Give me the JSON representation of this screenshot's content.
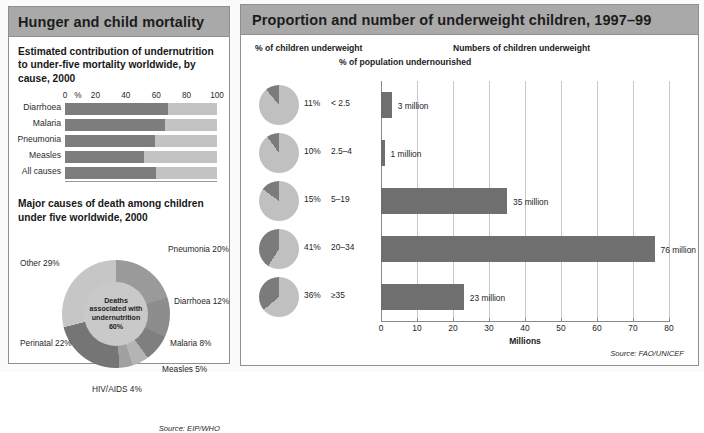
{
  "left_panel": {
    "header": "Hunger and child mortality",
    "chart1": {
      "title": "Estimated contribution of undernutrition to under-five mortality worldwide, by cause, 2000",
      "axis_unit": "%",
      "ticks": [
        "0",
        "20",
        "40",
        "60",
        "80",
        "100"
      ],
      "categories": [
        "Diarrhoea",
        "Malaria",
        "Pneumonia",
        "Measles",
        "All causes"
      ],
      "values": [
        68,
        66,
        59,
        52,
        60
      ]
    },
    "chart2": {
      "title": "Major causes of death among children under five worldwide, 2000",
      "center_label": "Deaths associated with undernutrition 60%",
      "slices": [
        {
          "label": "Pneumonia 20%",
          "value": 20
        },
        {
          "label": "Diarrhoea 12%",
          "value": 12
        },
        {
          "label": "Malaria 8%",
          "value": 8
        },
        {
          "label": "Measles 5%",
          "value": 5
        },
        {
          "label": "HIV/AIDS 4%",
          "value": 4
        },
        {
          "label": "Perinatal 22%",
          "value": 22
        },
        {
          "label": "Other 29%",
          "value": 29
        }
      ],
      "source": "Source: EIP/WHO"
    }
  },
  "right_panel": {
    "header": "Proportion and number of underweight children, 1997–99",
    "col_header_pies": "% of children underweight",
    "col_header_cats": "% of population undernourished",
    "col_header_bars": "Numbers of children underweight",
    "rows": [
      {
        "pie_pct": "11%",
        "pie_value": 11,
        "category": "< 2.5",
        "bar_value": 3,
        "bar_label": "3 million"
      },
      {
        "pie_pct": "10%",
        "pie_value": 10,
        "category": "2.5–4",
        "bar_value": 1,
        "bar_label": "1 million"
      },
      {
        "pie_pct": "15%",
        "pie_value": 15,
        "category": "5–19",
        "bar_value": 35,
        "bar_label": "35 million"
      },
      {
        "pie_pct": "41%",
        "pie_value": 41,
        "category": "20–34",
        "bar_value": 76,
        "bar_label": "76 million"
      },
      {
        "pie_pct": "36%",
        "pie_value": 36,
        "category": "≥35",
        "bar_value": 23,
        "bar_label": "23 million"
      }
    ],
    "x_ticks": [
      "0",
      "10",
      "20",
      "30",
      "40",
      "50",
      "60",
      "70",
      "80"
    ],
    "x_label": "Millions",
    "source": "Source: FAO/UNICEF"
  },
  "chart_data": [
    {
      "type": "bar",
      "orientation": "horizontal",
      "title": "Estimated contribution of undernutrition to under-five mortality worldwide, by cause, 2000",
      "categories": [
        "Diarrhoea",
        "Malaria",
        "Pneumonia",
        "Measles",
        "All causes"
      ],
      "values": [
        68,
        66,
        59,
        52,
        60
      ],
      "xlabel": "%",
      "ylabel": "",
      "xlim": [
        0,
        100
      ],
      "xticks": [
        0,
        20,
        40,
        60,
        80,
        100
      ],
      "grid": true,
      "legend": "none",
      "note": "Dark segment = share of deaths associated with undernutrition; light remainder = rest of 100%",
      "colors": {
        "fill": "#7d7d7d",
        "track": "#c3c3c3"
      }
    },
    {
      "type": "pie",
      "title": "Major causes of death among children under five worldwide, 2000",
      "categories": [
        "Pneumonia",
        "Diarrhoea",
        "Malaria",
        "Measles",
        "HIV/AIDS",
        "Perinatal",
        "Other"
      ],
      "values": [
        20,
        12,
        8,
        5,
        4,
        22,
        29
      ],
      "unit": "%",
      "center_annotation": "Deaths associated with undernutrition 60%",
      "legend": "labels around pie",
      "source": "Source: EIP/WHO"
    },
    {
      "type": "bar",
      "orientation": "horizontal",
      "title": "Proportion and number of underweight children, 1997-99",
      "categories": [
        "< 2.5",
        "2.5–4",
        "5–19",
        "20–34",
        "≥35"
      ],
      "category_axis_label": "% of population undernourished",
      "values": [
        3,
        1,
        35,
        76,
        23
      ],
      "data_labels": [
        "3 million",
        "1 million",
        "35 million",
        "76 million",
        "23 million"
      ],
      "xlabel": "Millions",
      "xlim": [
        0,
        80
      ],
      "xticks": [
        0,
        10,
        20,
        30,
        40,
        50,
        60,
        70,
        80
      ],
      "grid": true,
      "source": "Source: FAO/UNICEF",
      "companion_pies": {
        "title": "% of children underweight",
        "values": [
          11,
          10,
          15,
          41,
          36
        ],
        "unit": "%"
      },
      "colors": {
        "bar": "#6f6f6f"
      }
    }
  ],
  "theme": {
    "header_bg": "#a9a9a9",
    "bar_dark": "#7d7d7d",
    "bar_light": "#c3c3c3",
    "pie_dark": "#7b7b7b",
    "pie_light": "#c0c0c0",
    "border": "#8f8f8f"
  }
}
